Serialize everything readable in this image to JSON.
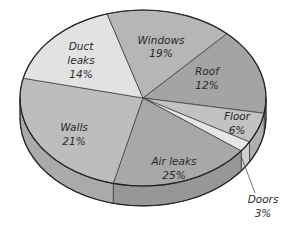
{
  "chart_data": {
    "type": "pie",
    "style": "3d-tilted",
    "title": "",
    "slices": [
      {
        "name": "Roof",
        "label_line1": "Roof",
        "label_line2": "12%",
        "value": 12,
        "color": "#a4a4a4",
        "start_deg": -47,
        "end_deg": 10
      },
      {
        "name": "Floor",
        "label_line1": "Floor",
        "label_line2": "6%",
        "value": 6,
        "color": "#c2c2c2",
        "start_deg": 10,
        "end_deg": 30
      },
      {
        "name": "Doors",
        "label_line1": "Doors",
        "label_line2": "3%",
        "value": 3,
        "color": "#e6e6e6",
        "start_deg": 30,
        "end_deg": 37
      },
      {
        "name": "Air leaks",
        "label_line1": "Air leaks",
        "label_line2": "25%",
        "value": 25,
        "color": "#a8a8a8",
        "start_deg": 37,
        "end_deg": 104
      },
      {
        "name": "Walls",
        "label_line1": "Walls",
        "label_line2": "21%",
        "value": 21,
        "color": "#bdbdbd",
        "start_deg": 104,
        "end_deg": 193
      },
      {
        "name": "Duct leaks",
        "label_line1": "Duct",
        "label_line1b": "leaks",
        "label_line2": "14%",
        "value": 14,
        "color": "#e2e2e2",
        "start_deg": 193,
        "end_deg": 253
      },
      {
        "name": "Windows",
        "label_line1": "Windows",
        "label_line2": "19%",
        "value": 19,
        "color": "#b6b6b6",
        "start_deg": 253,
        "end_deg": 313
      }
    ],
    "labels": {
      "windows": {
        "line1": "Windows",
        "line2": "19%"
      },
      "roof": {
        "line1": "Roof",
        "line2": "12%"
      },
      "duct": {
        "line1": "Duct",
        "line2": "leaks",
        "line3": "14%"
      },
      "walls": {
        "line1": "Walls",
        "line2": "21%"
      },
      "air": {
        "line1": "Air leaks",
        "line2": "25%"
      },
      "floor": {
        "line1": "Floor",
        "line2": "6%"
      },
      "doors": {
        "line1": "Doors",
        "line2": "3%"
      }
    },
    "legend": "none (labels placed on slices)"
  }
}
